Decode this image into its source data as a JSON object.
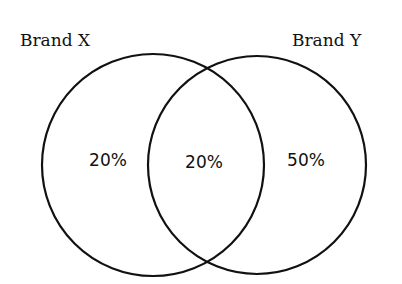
{
  "diagram": {
    "type": "venn",
    "colors": {
      "stroke": "#111111",
      "background": "#ffffff",
      "text": "#111111"
    },
    "sets": [
      {
        "id": "x",
        "label": "Brand X",
        "cx": 153,
        "cy": 165,
        "r": 111,
        "label_x": 20,
        "label_y": 46
      },
      {
        "id": "y",
        "label": "Brand Y",
        "cx": 257,
        "cy": 165,
        "r": 109,
        "label_x": 292,
        "label_y": 46
      }
    ],
    "regions": [
      {
        "id": "x_only",
        "label": "20%",
        "x": 108,
        "y": 166
      },
      {
        "id": "x_and_y",
        "label": "20%",
        "x": 204,
        "y": 168
      },
      {
        "id": "y_only",
        "label": "50%",
        "x": 306,
        "y": 166
      }
    ]
  }
}
